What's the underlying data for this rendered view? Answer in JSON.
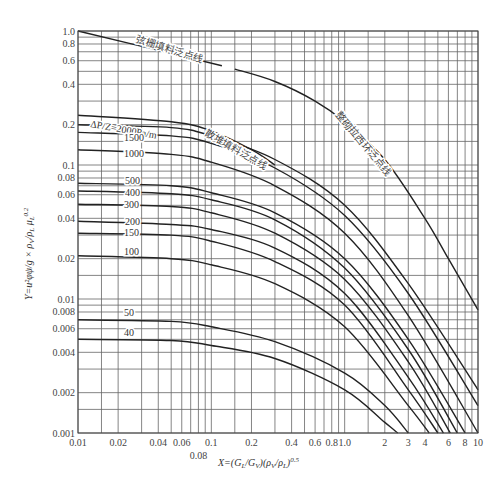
{
  "chart_data": {
    "type": "line",
    "title": "",
    "xscale": "log",
    "yscale": "log",
    "xlim": [
      0.01,
      10
    ],
    "ylim": [
      0.001,
      1.0
    ],
    "grid": true,
    "xlabel": "X=(G_L/G_V)(ρ_V/ρ_L)^0.5",
    "ylabel": "Y=(u²φψ/g)×(ρ_V/ρ_L)μ_L^0.2",
    "x_ticks": [
      "0.01",
      "0.02",
      "0.04",
      "0.06",
      "0.08",
      "0.1",
      "0.2",
      "0.4",
      "0.6",
      "0.8",
      "1.0",
      "2",
      "3",
      "4",
      "6",
      "8",
      "10"
    ],
    "y_ticks": [
      "1.0",
      "0.8",
      "0.6",
      "0.4",
      "0.2",
      "0.1",
      "0.08",
      "0.06",
      "0.04",
      "0.02",
      "0.01",
      "0.008",
      "0.006",
      "0.004",
      "0.002",
      "0.001"
    ],
    "parameter_label": "ΔP/Z=2000Pa/m",
    "series": [
      {
        "name": "弦栅填料泛点线",
        "style": "flooding",
        "x": [
          0.01,
          0.05,
          0.12
        ],
        "y": [
          1.0,
          0.68,
          0.55
        ]
      },
      {
        "name": "整砌拉西环泛点线",
        "style": "flooding",
        "x": [
          0.15,
          0.3,
          0.6,
          1.0,
          2,
          4,
          6,
          10
        ],
        "y": [
          0.52,
          0.42,
          0.3,
          0.21,
          0.11,
          0.04,
          0.02,
          0.0083
        ]
      },
      {
        "name": "散堆填料泛点线",
        "style": "flooding",
        "x": [
          0.01,
          0.05,
          0.1,
          0.2,
          0.3
        ],
        "y": [
          0.235,
          0.21,
          0.18,
          0.13,
          0.1
        ]
      },
      {
        "name": "2000",
        "x": [
          0.01,
          0.05,
          0.1,
          0.3,
          1,
          3,
          10
        ],
        "y": [
          0.2,
          0.19,
          0.165,
          0.11,
          0.05,
          0.013,
          0.0021
        ]
      },
      {
        "name": "1500",
        "x": [
          0.01,
          0.05,
          0.1,
          0.3,
          1,
          3,
          10
        ],
        "y": [
          0.175,
          0.165,
          0.145,
          0.095,
          0.042,
          0.011,
          0.0016
        ]
      },
      {
        "name": "1000",
        "x": [
          0.01,
          0.05,
          0.1,
          0.3,
          1,
          3,
          10
        ],
        "y": [
          0.13,
          0.12,
          0.105,
          0.07,
          0.031,
          0.0075,
          0.001
        ]
      },
      {
        "name": "500",
        "x": [
          0.01,
          0.05,
          0.1,
          0.3,
          1,
          3,
          8
        ],
        "y": [
          0.073,
          0.07,
          0.062,
          0.044,
          0.02,
          0.005,
          0.001
        ]
      },
      {
        "name": "400",
        "x": [
          0.01,
          0.05,
          0.1,
          0.3,
          1,
          3,
          7
        ],
        "y": [
          0.064,
          0.061,
          0.055,
          0.039,
          0.017,
          0.0042,
          0.001
        ]
      },
      {
        "name": "300",
        "x": [
          0.01,
          0.05,
          0.1,
          0.3,
          1,
          3,
          6.2
        ],
        "y": [
          0.051,
          0.049,
          0.044,
          0.031,
          0.014,
          0.0034,
          0.001
        ]
      },
      {
        "name": "200",
        "x": [
          0.01,
          0.05,
          0.1,
          0.3,
          1,
          3,
          5.5
        ],
        "y": [
          0.038,
          0.036,
          0.033,
          0.024,
          0.011,
          0.0026,
          0.001
        ]
      },
      {
        "name": "150",
        "x": [
          0.01,
          0.05,
          0.1,
          0.3,
          1,
          3,
          5
        ],
        "y": [
          0.031,
          0.03,
          0.027,
          0.019,
          0.009,
          0.0021,
          0.001
        ]
      },
      {
        "name": "100",
        "x": [
          0.01,
          0.05,
          0.1,
          0.3,
          1,
          3,
          4.3
        ],
        "y": [
          0.021,
          0.02,
          0.018,
          0.013,
          0.0062,
          0.0016,
          0.001
        ]
      },
      {
        "name": "50",
        "x": [
          0.01,
          0.05,
          0.1,
          0.3,
          1,
          2,
          3
        ],
        "y": [
          0.007,
          0.0068,
          0.0062,
          0.0048,
          0.0028,
          0.0016,
          0.001
        ]
      },
      {
        "name": "40",
        "x": [
          0.01,
          0.05,
          0.1,
          0.3,
          1,
          2,
          2.5
        ],
        "y": [
          0.005,
          0.0049,
          0.0045,
          0.0036,
          0.0021,
          0.0012,
          0.001
        ]
      }
    ],
    "annotations": [
      {
        "text": "弦栅填料泛点线"
      },
      {
        "text": "散堆填料泛点线"
      },
      {
        "text": "整砌拉西环泛点线"
      },
      {
        "text": "ΔP/Z=2000Pa/m"
      },
      {
        "text": "1500"
      },
      {
        "text": "1000"
      },
      {
        "text": "500"
      },
      {
        "text": "400"
      },
      {
        "text": "300"
      },
      {
        "text": "200"
      },
      {
        "text": "150"
      },
      {
        "text": "100"
      },
      {
        "text": "50"
      },
      {
        "text": "40"
      }
    ]
  },
  "labels": {
    "xlabel_prefix": "X=(G",
    "ylabel": "Y=(u²φψ/g)×(ρV/ρL)μL^0.2",
    "x_extra_tick": "0.08",
    "curve_2000": "ΔP/Z=2000Pa/m",
    "flood_grid": "弦栅填料泛点线",
    "flood_random": "散堆填料泛点线",
    "flood_stacked": "整砌拉西环泛点线"
  }
}
